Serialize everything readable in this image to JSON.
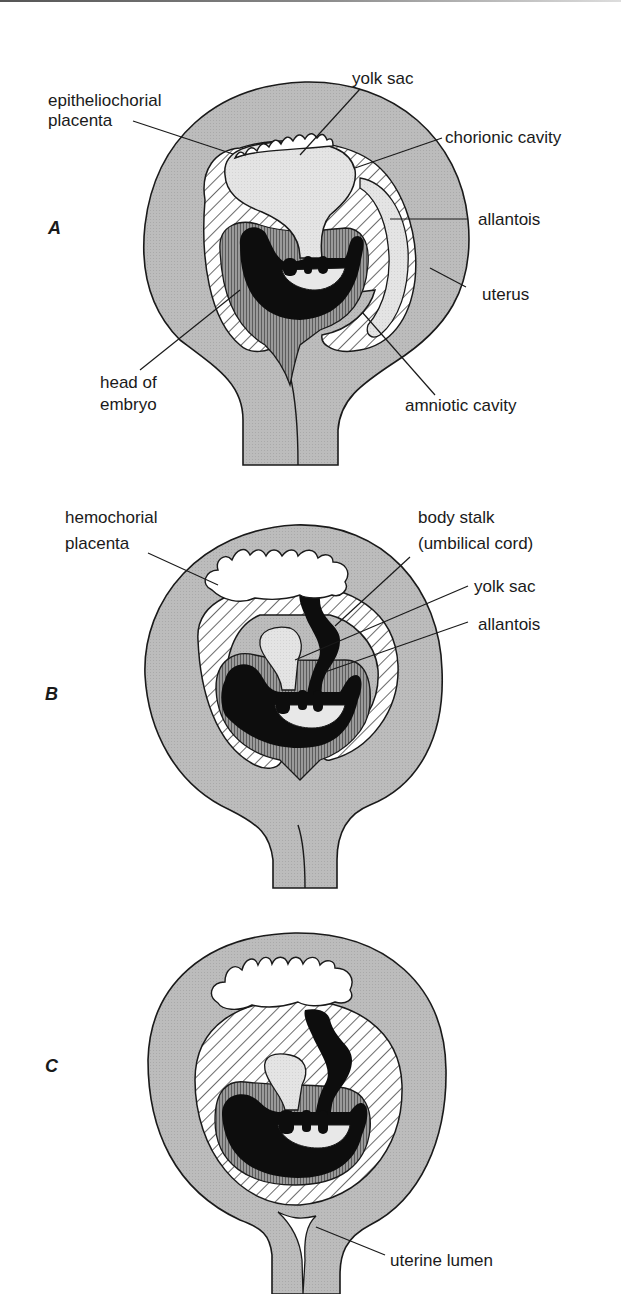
{
  "figure": {
    "colors": {
      "uterus": "#b9b9b9",
      "outline": "#1a1a1a",
      "yolk_sac": "#e2e2e2",
      "embryo": "#0d0d0d",
      "amnion_dark": "#8a8a8a",
      "hatch_bg": "#ffffff",
      "placenta": "#ffffff"
    },
    "panels": [
      {
        "id": "A",
        "label": "A",
        "placenta_type": "epitheliochorial",
        "annotations": [
          {
            "text_lines": [
              "epitheliochorial",
              "placenta"
            ],
            "target": "placenta"
          },
          {
            "text_lines": [
              "yolk sac"
            ],
            "target": "yolk sac"
          },
          {
            "text_lines": [
              "chorionic cavity"
            ],
            "target": "chorionic cavity"
          },
          {
            "text_lines": [
              "allantois"
            ],
            "target": "allantois"
          },
          {
            "text_lines": [
              "uterus"
            ],
            "target": "uterus"
          },
          {
            "text_lines": [
              "head of",
              "embryo"
            ],
            "target": "head of embryo"
          },
          {
            "text_lines": [
              "amniotic cavity"
            ],
            "target": "amniotic cavity"
          }
        ]
      },
      {
        "id": "B",
        "label": "B",
        "placenta_type": "hemochorial",
        "annotations": [
          {
            "text_lines": [
              "hemochorial",
              "placenta"
            ],
            "target": "placenta"
          },
          {
            "text_lines": [
              "body stalk",
              "(umbilical cord)"
            ],
            "target": "body stalk"
          },
          {
            "text_lines": [
              "yolk sac"
            ],
            "target": "yolk sac"
          },
          {
            "text_lines": [
              "allantois"
            ],
            "target": "allantois"
          }
        ]
      },
      {
        "id": "C",
        "label": "C",
        "annotations": [
          {
            "text_lines": [
              "uterine lumen"
            ],
            "target": "uterine lumen"
          }
        ]
      }
    ],
    "labels": {
      "A": {
        "panel": "A",
        "epi1": "epitheliochorial",
        "epi2": "placenta",
        "yolk": "yolk sac",
        "chorionic": "chorionic cavity",
        "allantois": "allantois",
        "uterus": "uterus",
        "head1": "head of",
        "head2": "embryo",
        "amniotic": "amniotic cavity"
      },
      "B": {
        "panel": "B",
        "hemo1": "hemochorial",
        "hemo2": "placenta",
        "stalk1": "body stalk",
        "stalk2": "(umbilical cord)",
        "yolk": "yolk sac",
        "allantois": "allantois"
      },
      "C": {
        "panel": "C",
        "lumen": "uterine lumen"
      }
    }
  }
}
